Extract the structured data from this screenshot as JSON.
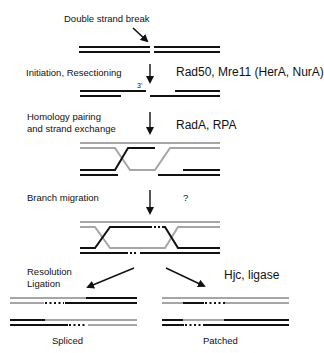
{
  "colors": {
    "dark": "#111111",
    "grey": "#a6a6a6"
  },
  "labels": {
    "dsb": "Double strand break",
    "initiation": "Initiation, Resectioning",
    "three_prime": "3'",
    "homology_line1": "Homology pairing",
    "homology_line2": "and strand exchange",
    "branch": "Branch migration",
    "resolution_line1": "Resolution",
    "resolution_line2": "Ligation",
    "spliced": "Spliced",
    "patched": "Patched"
  },
  "proteins": {
    "initiation": "Rad50, Mre11 (HerA, NurA)",
    "homology": "RadA, RPA",
    "branch": "?",
    "resolution": "Hjc, ligase"
  }
}
